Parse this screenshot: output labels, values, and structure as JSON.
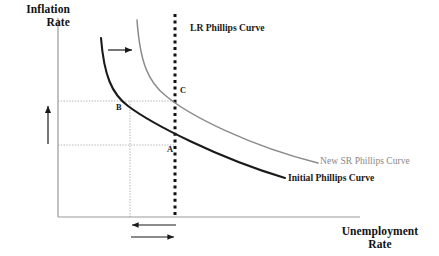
{
  "figure": {
    "kind": "economics-diagram",
    "name": "Phillips Curve shift diagram",
    "background_color": "#ffffff"
  },
  "axes": {
    "y_title": "Inflation\nRate",
    "y_title_line1": "Inflation",
    "y_title_line2": "Rate",
    "x_title_line1": "Unemployment",
    "x_title_line2": "Rate",
    "axis_color": "#999999",
    "origin_px": {
      "x": 58,
      "y": 217
    },
    "y_top_px": 18,
    "x_right_px": 360
  },
  "curves": [
    {
      "id": "initial-phillips-curve",
      "label": "Initial Phillips Curve",
      "color": "#1a1a1a",
      "label_color": "#1a1a1a",
      "label_weight": "bold",
      "width": 2.1,
      "style": "solid",
      "role": "short-run Phillips curve before shift"
    },
    {
      "id": "new-sr-phillips-curve",
      "label": "New SR Phillips Curve",
      "color": "#8a8a8a",
      "label_color": "#8a8a8a",
      "label_weight": "normal",
      "width": 1.5,
      "style": "solid",
      "role": "short-run Phillips curve after shift"
    },
    {
      "id": "lr-phillips-curve",
      "label": "LR Phillips Curve",
      "color": "#111111",
      "label_color": "#1a1a1a",
      "label_weight": "bold",
      "width": 3,
      "style": "dotted",
      "role": "long-run vertical Phillips curve at natural rate",
      "x_px": 175
    }
  ],
  "points": [
    {
      "id": "point-a",
      "label": "A",
      "x_px": 175,
      "y_px": 150,
      "on_curve": "initial-phillips-curve"
    },
    {
      "id": "point-b",
      "label": "B",
      "x_px": 130,
      "y_px": 101,
      "on_curve": "initial-phillips-curve"
    },
    {
      "id": "point-c",
      "label": "C",
      "x_px": 175,
      "y_px": 93,
      "on_curve": "new-sr-phillips-curve"
    }
  ],
  "guides": {
    "color": "#b4b4b4",
    "horizontal": [
      {
        "id": "gridline-inflation-b",
        "y_px": 101,
        "from_x_px": 58,
        "to_x_px": 176
      },
      {
        "id": "gridline-inflation-a",
        "y_px": 145,
        "from_x_px": 58,
        "to_x_px": 176
      }
    ],
    "vertical": [
      {
        "id": "gridline-unemployment-b",
        "x_px": 130,
        "from_y_px": 101,
        "to_y_px": 217
      }
    ]
  },
  "annotations": [
    {
      "id": "shift-arrow",
      "kind": "arrow",
      "direction": "right",
      "meaning": "short-run Phillips curve shifts right",
      "from_px": {
        "x": 108,
        "y": 50
      },
      "to_px": {
        "x": 134,
        "y": 50
      },
      "color": "#1a1a1a"
    },
    {
      "id": "inflation-rise-arrow",
      "kind": "arrow",
      "direction": "up",
      "meaning": "inflation rate increases",
      "from_px": {
        "x": 48,
        "y": 144
      },
      "to_px": {
        "x": 48,
        "y": 104
      },
      "color": "#1a1a1a"
    },
    {
      "id": "unemployment-fall-arrow",
      "kind": "arrow",
      "direction": "left",
      "meaning": "unemployment falls below natural rate",
      "from_px": {
        "x": 176,
        "y": 225
      },
      "to_px": {
        "x": 130,
        "y": 225
      },
      "color": "#1a1a1a"
    },
    {
      "id": "unemployment-return-arrow",
      "kind": "arrow",
      "direction": "right",
      "meaning": "unemployment returns to natural rate",
      "from_px": {
        "x": 131,
        "y": 237
      },
      "to_px": {
        "x": 176,
        "y": 237
      },
      "color": "#1a1a1a"
    }
  ]
}
